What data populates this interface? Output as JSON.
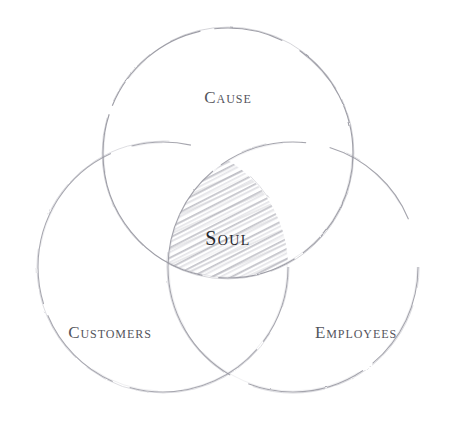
{
  "diagram": {
    "type": "venn-3-set",
    "background_color": "#ffffff",
    "style": "hand-drawn pencil sketch",
    "stroke_color": "#9a9aa2",
    "hatch_color": "#b8b8c0",
    "label_color": "#54545c",
    "core_label_color": "#26262c",
    "sets": [
      {
        "id": "cause",
        "label": "Cause",
        "position": "top",
        "center_x": 228,
        "center_y": 153,
        "radius": 125,
        "label_x": 228,
        "label_y": 99
      },
      {
        "id": "customers",
        "label": "Customers",
        "position": "bottom-left",
        "center_x": 163,
        "center_y": 267,
        "radius": 125,
        "label_x": 110,
        "label_y": 334
      },
      {
        "id": "employees",
        "label": "Employees",
        "position": "bottom-right",
        "center_x": 293,
        "center_y": 267,
        "radius": 125,
        "label_x": 356,
        "label_y": 334
      }
    ],
    "intersection": {
      "id": "soul",
      "label": "Soul",
      "description": "triple intersection of Cause, Customers and Employees",
      "fill": "diagonal-hatching",
      "hatch_angle_degrees": 27,
      "label_x": 228,
      "label_y": 240
    }
  }
}
